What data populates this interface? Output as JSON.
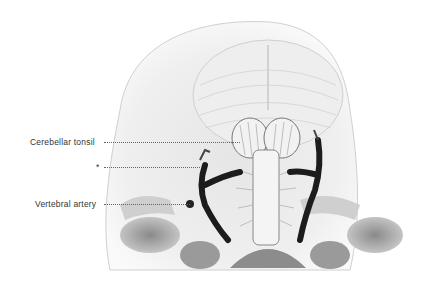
{
  "figure": {
    "colors": {
      "background": "#ffffff",
      "bone": "#d9d9d9",
      "shadow": "#7a7a7a",
      "artery": "#1c1c1c",
      "line": "#555555"
    }
  },
  "labels": [
    {
      "text": "Cerebellar tonsil",
      "x": 30,
      "y": 137,
      "line_to_x": 240
    },
    {
      "text": "*",
      "x": 97,
      "y": 162,
      "line_to_x": 200
    },
    {
      "text": "Vertebral artery",
      "x": 35,
      "y": 199,
      "line_to_x": 190
    }
  ]
}
